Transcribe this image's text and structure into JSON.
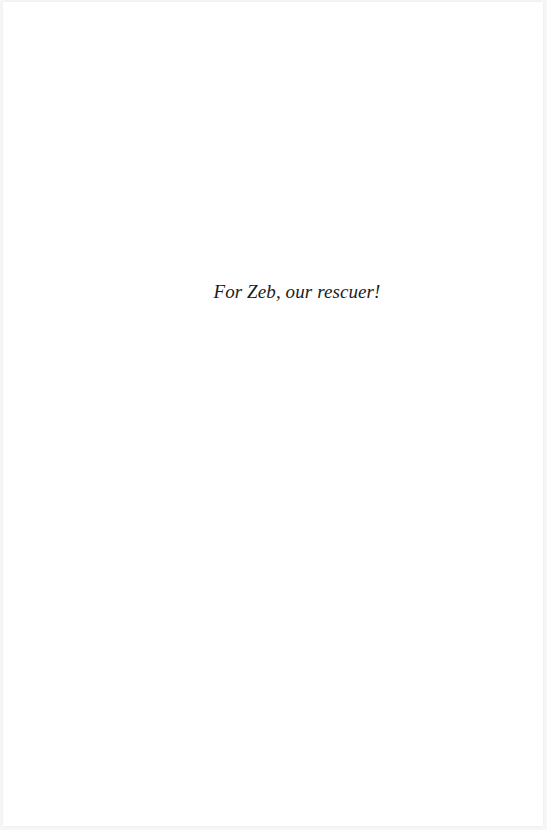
{
  "page": {
    "type": "dedication",
    "dedication_text": "For Zeb, our rescuer!",
    "background_color": "#ffffff",
    "text_color": "#1c1c1c"
  }
}
